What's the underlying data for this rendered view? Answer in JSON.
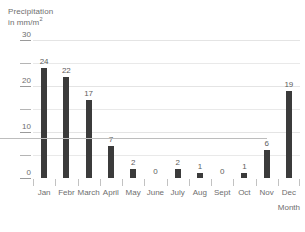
{
  "chart_data": {
    "type": "bar",
    "title": "Precipitation in mm/m2",
    "title_line1": "Precipitation",
    "title_line2_prefix": "in mm/m",
    "title_line2_sup": "2",
    "xlabel": "Month",
    "ylabel": "Precipitation in mm/m2",
    "categories": [
      "Jan",
      "Febr",
      "March",
      "April",
      "May",
      "June",
      "July",
      "Aug",
      "Sept",
      "Oct",
      "Nov",
      "Dec"
    ],
    "values": [
      24,
      22,
      17,
      7,
      2,
      0,
      2,
      1,
      0,
      1,
      6,
      19
    ],
    "value_labels": [
      "24",
      "22",
      "17",
      "7",
      "2",
      "0",
      "2",
      "1",
      "0",
      "1",
      "6",
      "19"
    ],
    "ylim": [
      0,
      30
    ],
    "ytick_values": [
      0,
      5,
      10,
      15,
      20,
      25,
      30
    ],
    "ytick_labels": [
      "0",
      "",
      "10",
      "",
      "20",
      "",
      "30"
    ],
    "ytick_labeled": [
      true,
      false,
      true,
      false,
      true,
      false,
      true
    ],
    "grid": true,
    "grid_interval": 5,
    "legend": "none",
    "bar_color": "#3b3b3b",
    "grid_color": "#e9e9e9",
    "axis_color": "#bdbdbd",
    "text_color": "#6e6e6e"
  }
}
